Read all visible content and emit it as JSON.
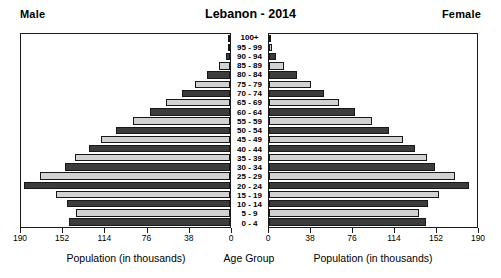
{
  "header": {
    "male_label": "Male",
    "female_label": "Female",
    "title": "Lebanon - 2014"
  },
  "axis_titles": {
    "male": "Population (in thousands)",
    "age": "Age Group",
    "female": "Population (in thousands)"
  },
  "chart_data": {
    "type": "bar",
    "subtype": "population-pyramid",
    "title": "Lebanon - 2014",
    "xlabel": "Population (in thousands)",
    "ylabel": "Age Group",
    "grid": false,
    "legend": [
      "Male",
      "Female"
    ],
    "legend_position": "top-corners",
    "xlim": [
      0,
      190
    ],
    "xticks_male": [
      190,
      152,
      114,
      76,
      38,
      0
    ],
    "xticks_female": [
      0,
      38,
      76,
      114,
      152,
      190
    ],
    "categories": [
      "100+",
      "95 - 99",
      "90 - 94",
      "85 - 89",
      "80 - 84",
      "75 - 79",
      "70 - 74",
      "65 - 69",
      "60 - 64",
      "55 - 59",
      "50 - 54",
      "45 - 49",
      "40 - 44",
      "35 - 39",
      "30 - 34",
      "25 - 29",
      "20 - 24",
      "15 - 19",
      "10 - 14",
      "5 - 9",
      "0 - 4"
    ],
    "series": [
      {
        "name": "Male",
        "shade": "alternating",
        "values": [
          0.3,
          1.5,
          4,
          10,
          21,
          32,
          44,
          58,
          73,
          88,
          104,
          117,
          128,
          141,
          150,
          173,
          187,
          158,
          148,
          140,
          146
        ]
      },
      {
        "name": "Female",
        "shade": "alternating",
        "values": [
          0.6,
          2.5,
          6,
          14,
          26,
          38,
          50,
          64,
          79,
          94,
          110,
          122,
          133,
          144,
          152,
          170,
          183,
          155,
          145,
          137,
          143
        ]
      }
    ]
  },
  "colors": {
    "bar_dark": "#3c3c3c",
    "bar_light": "#d2d2d2",
    "frame": "#1a1a1a",
    "background": "#ffffff"
  }
}
